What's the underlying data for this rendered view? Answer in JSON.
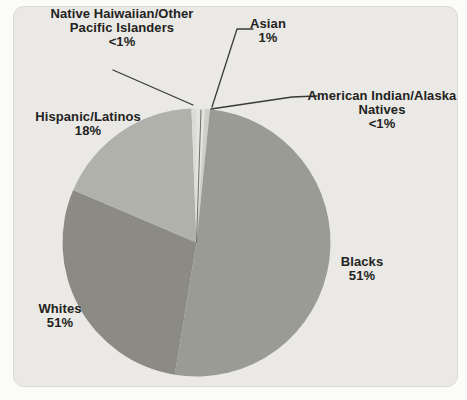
{
  "colors": {
    "page_background": "#fbfbf8",
    "card_background": "#eae9e5",
    "card_border": "#dbdad6",
    "leader_line": "#3a3a36",
    "slice_divider_line": "#6e6e66",
    "label_text": "#232321"
  },
  "chart_data": {
    "type": "pie",
    "title": "",
    "legend": "none",
    "geometry": {
      "cx": 196.5,
      "cy": 242.5,
      "r": 134,
      "start_angle_deg_from_12": 0,
      "direction": "clockwise"
    },
    "slices": [
      {
        "name": "asian",
        "label": "Asian",
        "pct_label": "1%",
        "drawn_pct": 1.0,
        "color": "#e3e3df"
      },
      {
        "name": "american-indian-alaska-natives",
        "label": "American Indian/Alaska Natives",
        "pct_label": "<1%",
        "drawn_pct": 0.6,
        "color": "#cfcfca"
      },
      {
        "name": "blacks",
        "label": "Blacks",
        "pct_label": "51%",
        "drawn_pct": 51.0,
        "color": "#9b9b95"
      },
      {
        "name": "whites",
        "label": "Whites",
        "pct_label": "51%",
        "drawn_pct": 28.8,
        "color": "#8b8b84"
      },
      {
        "name": "hispanic-latinos",
        "label": "Hispanic/Latinos",
        "pct_label": "18%",
        "drawn_pct": 18.0,
        "color": "#b1b1ac"
      },
      {
        "name": "native-haiwaiian-other-pacific-islanders",
        "label": "Native Haiwaiian/Other Pacific Islanders",
        "pct_label": "<1%",
        "drawn_pct": 0.6,
        "color": "#dcdcd7"
      }
    ],
    "annotations": [
      {
        "name": "native-haiwaiian-label",
        "cx": 122,
        "top": 7,
        "lines": [
          "Native Haiwaiian/Other",
          "Pacific Islanders",
          "<1%"
        ]
      },
      {
        "name": "asian-label",
        "cx": 268,
        "top": 17,
        "lines": [
          "Asian",
          "1%"
        ]
      },
      {
        "name": "american-indian-label",
        "cx": 382,
        "top": 89,
        "lines": [
          "American Indian/Alaska",
          "Natives",
          "<1%"
        ]
      },
      {
        "name": "hispanic-label",
        "cx": 88,
        "top": 110,
        "lines": [
          "Hispanic/Latinos",
          "18%"
        ]
      },
      {
        "name": "blacks-label",
        "cx": 362,
        "top": 255,
        "lines": [
          "Blacks",
          "51%"
        ]
      },
      {
        "name": "whites-label",
        "cx": 60,
        "top": 302,
        "lines": [
          "Whites",
          "51%"
        ]
      }
    ],
    "leader_lines": [
      {
        "name": "asian-leader",
        "points": [
          [
            212,
            107
          ],
          [
            237,
            29
          ],
          [
            253,
            29
          ]
        ]
      },
      {
        "name": "american-indian-leader",
        "points": [
          [
            211,
            109
          ],
          [
            292,
            97
          ],
          [
            317,
            96
          ]
        ]
      },
      {
        "name": "native-haiwaiian-leader",
        "points": [
          [
            193,
            105
          ],
          [
            113,
            70
          ]
        ]
      },
      {
        "name": "top-slice-divider",
        "points": [
          [
            196.5,
            242.5
          ],
          [
            201,
            110
          ]
        ],
        "divider": true
      }
    ]
  }
}
